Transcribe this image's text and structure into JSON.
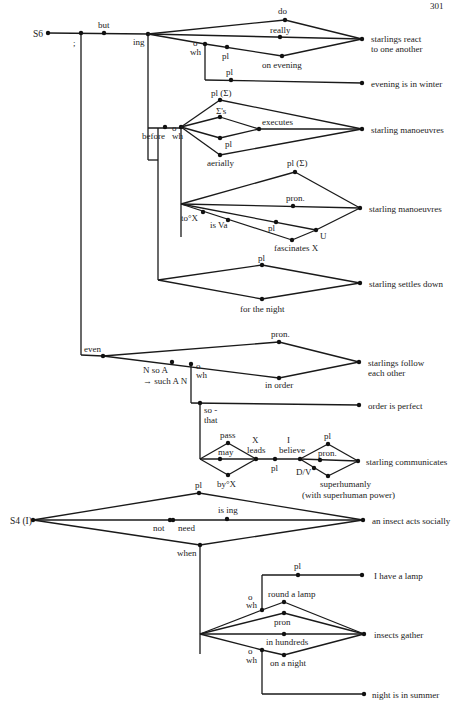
{
  "page_number": "301",
  "diagram": {
    "sentences": [
      {
        "id": "S6",
        "label": "S6"
      },
      {
        "id": "S4",
        "label": "S4 (I)"
      }
    ],
    "outputs": [
      "starlings react to one another",
      "evening is in winter",
      "starling manoeuvres",
      "starling manoeuvres",
      "starling settles down",
      "starlings follow each other",
      "order is perfect",
      "starling communicates",
      "an insect acts socially",
      "I have a lamp",
      "insects gather",
      "night is in summer"
    ],
    "labels": {
      "s6": "S6",
      "semicolon": ";",
      "but": "but",
      "ing": "ing",
      "do": "do",
      "really": "really",
      "wh": "wh",
      "pl": "pl",
      "on_evening": "on evening",
      "react_1": "starlings react",
      "react_2": "to one another",
      "evening_winter": "evening is in winter",
      "pl_sigma": "pl (Σ)",
      "sigma_s": "Σ's",
      "executes": "executes",
      "before": "before",
      "aerially": "aerially",
      "manoeuvres": "starling manoeuvres",
      "pron_dot": "pron.",
      "to_x": "to°X",
      "is_va": "is Va",
      "u": "U",
      "fascinates": "fascinates X",
      "settles": "starling settles down",
      "for_night": "for the night",
      "even": "even",
      "n_so_a": "N so A",
      "such_an": "→ such A N",
      "in_order": "in order",
      "follow_1": "starlings follow",
      "follow_2": "each other",
      "so_that_1": "so -",
      "so_that_2": "that",
      "order_perfect": "order is perfect",
      "pass": "pass",
      "may": "may",
      "by_x": "by°X",
      "x": "X",
      "leads": "leads",
      "i": "I",
      "believe": "believe",
      "dv": "D/V",
      "superhumanly": "superhumanly",
      "with_power": "(with superhuman power)",
      "communicates": "starling communicates",
      "s4": "S4 (I)",
      "is_ing": "is ing",
      "not": "not",
      "need": "need",
      "when": "when",
      "insect_social": "an insect acts socially",
      "lamp": "I have a lamp",
      "round_lamp": "round a lamp",
      "pron": "pron",
      "in_hundreds": "in hundreds",
      "on_night": "on a night",
      "gather": "insects gather",
      "night_summer": "night is in summer",
      "circle": "o"
    }
  }
}
